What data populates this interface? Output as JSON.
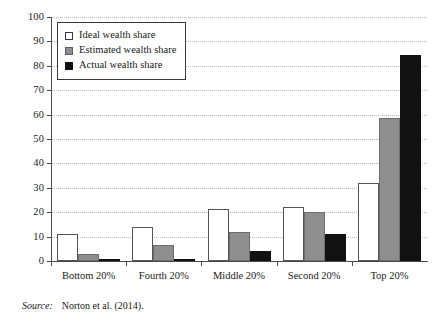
{
  "chart_data": {
    "type": "bar",
    "title": "",
    "xlabel": "",
    "ylabel": "",
    "ylim": [
      0,
      100
    ],
    "ytick_step": 10,
    "yticks": [
      "0",
      "10",
      "20",
      "30",
      "40",
      "50",
      "60",
      "70",
      "80",
      "90",
      "100"
    ],
    "grid": true,
    "legend_position": "upper-left-inside",
    "categories": [
      "Bottom 20%",
      "Fourth 20%",
      "Middle 20%",
      "Second 20%",
      "Top 20%"
    ],
    "series": [
      {
        "name": "Ideal wealth share",
        "color": "#ffffff",
        "values": [
          11,
          14,
          21.5,
          22,
          32
        ]
      },
      {
        "name": "Estimated wealth share",
        "color": "#8e8e8e",
        "values": [
          3,
          6.5,
          12,
          20,
          58.5
        ]
      },
      {
        "name": "Actual wealth share",
        "color": "#111111",
        "values": [
          0.2,
          0.3,
          4,
          11,
          84.5
        ]
      }
    ]
  },
  "legend": {
    "items": [
      {
        "label": "Ideal wealth share",
        "swatch": "ideal"
      },
      {
        "label": "Estimated wealth share",
        "swatch": "estimated"
      },
      {
        "label": "Actual wealth share",
        "swatch": "actual"
      }
    ]
  },
  "source": {
    "label": "Source:",
    "text": "Norton et al. (2014)."
  }
}
